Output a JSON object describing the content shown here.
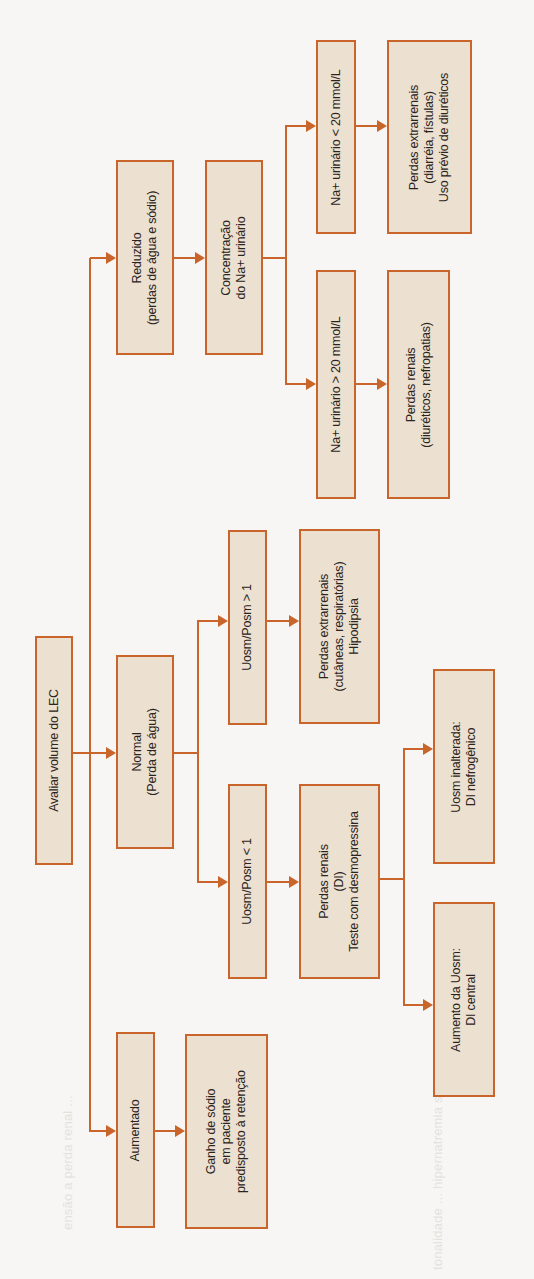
{
  "orientation": "rotated 90 degrees counter-clockwise",
  "colors": {
    "box_fill": "#ece0d0",
    "box_border": "#c9652a",
    "connector": "#c9652a",
    "text": "#2a2320",
    "background": "#f7f6f4"
  },
  "flowchart": {
    "root": {
      "lines": [
        "Avaliar volume do LEC"
      ]
    },
    "reduzido": {
      "lines": [
        "Reduzido",
        "(perdas de água e sódio)"
      ]
    },
    "concentracao": {
      "lines": [
        "Concentração",
        "do Na+ urinário"
      ]
    },
    "na_menor": {
      "lines": [
        "Na+ urinário < 20 mmol/L"
      ]
    },
    "extrarrenais_diarreia": {
      "lines": [
        "Perdas extrarrenais",
        "(diarréia, fístulas)",
        "Uso prévio de diuréticos"
      ]
    },
    "na_maior": {
      "lines": [
        "Na+ urinário > 20 mmol/L"
      ]
    },
    "renais_diureticos": {
      "lines": [
        "Perdas renais",
        "(diuréticos, nefropatias)"
      ]
    },
    "normal": {
      "lines": [
        "Normal",
        "(Perda de água)"
      ]
    },
    "uosm_maior": {
      "lines": [
        "Uosm/Posm > 1"
      ]
    },
    "extrarrenais_cutaneas": {
      "lines": [
        "Perdas extrarrenais",
        "(cutâneas, respiratórias)",
        "Hipodipsia"
      ]
    },
    "uosm_menor": {
      "lines": [
        "Uosm/Posm < 1"
      ]
    },
    "renais_di": {
      "lines": [
        "Perdas renais",
        "(DI)",
        "Teste com desmopressina"
      ]
    },
    "uosm_inalterada": {
      "lines": [
        "Uosm inalterada:",
        "DI nefrogênico"
      ]
    },
    "aumento_uosm": {
      "lines": [
        "Aumento da Uosm:",
        "DI central"
      ]
    },
    "aumentado": {
      "lines": [
        "Aumentado"
      ]
    },
    "ganho_sodio": {
      "lines": [
        "Ganho de sódio",
        "em paciente",
        "predisposto à retenção"
      ]
    }
  }
}
